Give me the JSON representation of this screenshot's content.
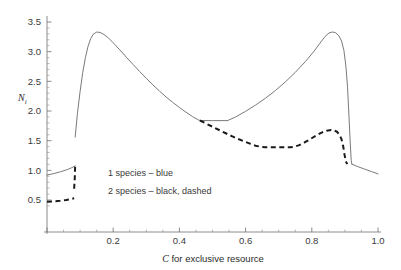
{
  "chart_data": {
    "type": "line",
    "title": "",
    "xlabel": "C for exclusive resource",
    "ylabel": "N",
    "ylabel_sub": "i",
    "xlim": [
      0.0,
      1.0
    ],
    "ylim": [
      0.35,
      3.62
    ],
    "grid": false,
    "legend_position": "inside-left",
    "xticks": [
      0.0,
      0.2,
      0.4,
      0.6,
      0.8,
      1.0
    ],
    "xtick_labels": [
      "",
      "0.2",
      "0.4",
      "0.6",
      "0.8",
      "1.0"
    ],
    "xtick_minor_step": 0.05,
    "yticks": [
      0.5,
      1.0,
      1.5,
      2.0,
      2.5,
      3.0,
      3.5
    ],
    "ytick_labels": [
      "0.5",
      "1.0",
      "1.5",
      "2.0",
      "2.5",
      "3.0",
      "3.5"
    ],
    "ytick_minor_step": 0.1,
    "series": [
      {
        "name": "1 species",
        "legend_label": "1  species – blue",
        "style": "solid",
        "color": "#7a7a7a",
        "width": 1.0,
        "segments": [
          [
            [
              0.0,
              0.92
            ],
            [
              0.02,
              0.945
            ],
            [
              0.04,
              0.975
            ],
            [
              0.06,
              1.01
            ],
            [
              0.075,
              1.045
            ],
            [
              0.085,
              1.075
            ]
          ],
          [
            [
              0.085,
              1.56
            ],
            [
              0.092,
              1.96
            ],
            [
              0.1,
              2.33
            ],
            [
              0.108,
              2.65
            ],
            [
              0.116,
              2.9
            ],
            [
              0.124,
              3.09
            ],
            [
              0.132,
              3.22
            ],
            [
              0.14,
              3.295
            ],
            [
              0.15,
              3.33
            ],
            [
              0.16,
              3.325
            ],
            [
              0.172,
              3.29
            ],
            [
              0.186,
              3.23
            ],
            [
              0.2,
              3.15
            ],
            [
              0.22,
              3.03
            ],
            [
              0.24,
              2.905
            ],
            [
              0.26,
              2.785
            ],
            [
              0.28,
              2.665
            ],
            [
              0.3,
              2.55
            ],
            [
              0.32,
              2.44
            ],
            [
              0.34,
              2.335
            ],
            [
              0.36,
              2.235
            ],
            [
              0.38,
              2.145
            ],
            [
              0.4,
              2.06
            ],
            [
              0.42,
              1.98
            ],
            [
              0.44,
              1.905
            ],
            [
              0.455,
              1.855
            ],
            [
              0.462,
              1.84
            ]
          ],
          [
            [
              0.462,
              1.84
            ],
            [
              0.5,
              1.838
            ],
            [
              0.545,
              1.838
            ]
          ],
          [
            [
              0.545,
              1.838
            ],
            [
              0.57,
              1.9
            ],
            [
              0.6,
              1.995
            ],
            [
              0.63,
              2.1
            ],
            [
              0.66,
              2.215
            ],
            [
              0.69,
              2.345
            ],
            [
              0.72,
              2.49
            ],
            [
              0.75,
              2.65
            ],
            [
              0.78,
              2.83
            ],
            [
              0.805,
              2.995
            ],
            [
              0.825,
              3.145
            ],
            [
              0.84,
              3.255
            ],
            [
              0.852,
              3.315
            ],
            [
              0.862,
              3.332
            ],
            [
              0.872,
              3.32
            ],
            [
              0.882,
              3.265
            ],
            [
              0.89,
              3.18
            ],
            [
              0.897,
              3.02
            ],
            [
              0.903,
              2.76
            ],
            [
              0.908,
              2.4
            ],
            [
              0.912,
              1.95
            ],
            [
              0.916,
              1.48
            ],
            [
              0.919,
              1.17
            ],
            [
              0.921,
              1.105
            ]
          ],
          [
            [
              0.921,
              1.105
            ],
            [
              0.94,
              1.06
            ],
            [
              0.96,
              1.02
            ],
            [
              0.98,
              0.98
            ],
            [
              1.0,
              0.94
            ]
          ]
        ]
      },
      {
        "name": "2 species",
        "legend_label": "2 species – black, dashed",
        "style": "dashed",
        "color": "#1a1a1a",
        "width": 2.0,
        "dash": "5,3.5",
        "segments": [
          [
            [
              0.0,
              0.47
            ],
            [
              0.02,
              0.478
            ],
            [
              0.04,
              0.488
            ],
            [
              0.058,
              0.5
            ],
            [
              0.072,
              0.515
            ],
            [
              0.082,
              0.528
            ]
          ],
          [
            [
              0.082,
              0.69
            ],
            [
              0.084,
              0.88
            ],
            [
              0.085,
              1.075
            ]
          ],
          [
            [
              0.462,
              1.84
            ],
            [
              0.48,
              1.79
            ],
            [
              0.5,
              1.735
            ],
            [
              0.52,
              1.68
            ],
            [
              0.54,
              1.625
            ],
            [
              0.56,
              1.572
            ],
            [
              0.58,
              1.523
            ],
            [
              0.6,
              1.478
            ],
            [
              0.615,
              1.445
            ],
            [
              0.63,
              1.415
            ],
            [
              0.645,
              1.398
            ],
            [
              0.66,
              1.39
            ],
            [
              0.68,
              1.387
            ],
            [
              0.7,
              1.388
            ],
            [
              0.72,
              1.39
            ],
            [
              0.735,
              1.388
            ],
            [
              0.748,
              1.398
            ],
            [
              0.762,
              1.425
            ],
            [
              0.778,
              1.47
            ],
            [
              0.795,
              1.525
            ],
            [
              0.812,
              1.582
            ],
            [
              0.828,
              1.632
            ],
            [
              0.845,
              1.668
            ],
            [
              0.858,
              1.68
            ],
            [
              0.868,
              1.672
            ],
            [
              0.876,
              1.65
            ],
            [
              0.884,
              1.598
            ],
            [
              0.89,
              1.52
            ],
            [
              0.895,
              1.4
            ],
            [
              0.899,
              1.26
            ],
            [
              0.903,
              1.15
            ],
            [
              0.907,
              1.105
            ]
          ]
        ]
      }
    ],
    "annotations": [
      {
        "text": "1  species – blue",
        "x": 0.22,
        "y": 1.1
      },
      {
        "text": "2 species – black, dashed",
        "x": 0.22,
        "y": 0.82
      }
    ]
  },
  "legend": {
    "line1": "1  species – blue",
    "line2": "2 species – black, dashed"
  },
  "axes": {
    "x_title": "C for exclusive resource",
    "x_title_italic_prefix": "C",
    "x_title_rest": " for exclusive resource",
    "y_title": "N",
    "y_title_subscript": "i"
  },
  "colors": {
    "solid_curve": "#7a7a7a",
    "dashed_curve": "#1a1a1a",
    "axis": "#6f6f6f",
    "text": "#3a3a3a",
    "background": "#ffffff"
  }
}
